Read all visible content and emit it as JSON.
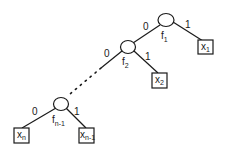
{
  "diagram": {
    "type": "decision-tree",
    "stroke_color": "#1a1a1a",
    "background": "#ffffff",
    "nodes": [
      {
        "id": "f1",
        "label": "f",
        "sub": "1",
        "kind": "decision"
      },
      {
        "id": "f2",
        "label": "f",
        "sub": "2",
        "kind": "decision"
      },
      {
        "id": "fn-1",
        "label": "f",
        "sub": "n-1",
        "kind": "decision"
      },
      {
        "id": "x1",
        "label": "x",
        "sub": "1",
        "kind": "leaf"
      },
      {
        "id": "x2",
        "label": "x",
        "sub": "2",
        "kind": "leaf"
      },
      {
        "id": "xn",
        "label": "x",
        "sub": "n",
        "kind": "leaf"
      },
      {
        "id": "xn-1",
        "label": "x",
        "sub": "n-1",
        "kind": "leaf"
      }
    ],
    "edges": [
      {
        "from": "f1",
        "to": "f2",
        "label": "0"
      },
      {
        "from": "f1",
        "to": "x1",
        "label": "1"
      },
      {
        "from": "f2",
        "to": "fn-1",
        "label": "0",
        "style": "dotted"
      },
      {
        "from": "f2",
        "to": "x2",
        "label": "1"
      },
      {
        "from": "fn-1",
        "to": "xn",
        "label": "0"
      },
      {
        "from": "fn-1",
        "to": "xn-1",
        "label": "1"
      }
    ]
  }
}
